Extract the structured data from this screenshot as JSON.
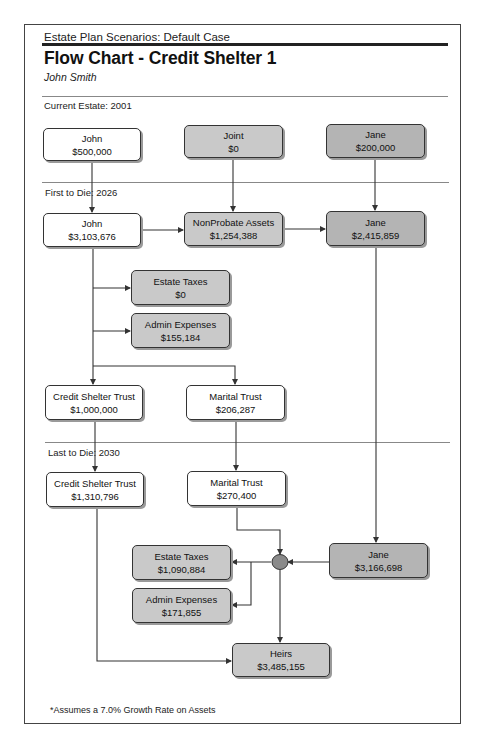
{
  "header": {
    "scenario": "Estate Plan Scenarios:  Default Case",
    "title": "Flow Chart - Credit Shelter 1",
    "client": "John Smith"
  },
  "sections": {
    "current": "Current Estate: 2001",
    "first": "First to Die: 2026",
    "last": "Last to Die: 2030"
  },
  "nodes": {
    "john_current": {
      "label": "John",
      "value": "$500,000"
    },
    "joint_current": {
      "label": "Joint",
      "value": "$0"
    },
    "jane_current": {
      "label": "Jane",
      "value": "$200,000"
    },
    "john_first": {
      "label": "John",
      "value": "$3,103,676"
    },
    "nonprobate_first": {
      "label": "NonProbate Assets",
      "value": "$1,254,388"
    },
    "jane_first": {
      "label": "Jane",
      "value": "$2,415,859"
    },
    "estate_taxes_first": {
      "label": "Estate Taxes",
      "value": "$0"
    },
    "admin_expenses_first": {
      "label": "Admin Expenses",
      "value": "$155,184"
    },
    "cst_first": {
      "label": "Credit Shelter Trust",
      "value": "$1,000,000"
    },
    "marital_first": {
      "label": "Marital Trust",
      "value": "$206,287"
    },
    "cst_last": {
      "label": "Credit Shelter Trust",
      "value": "$1,310,796"
    },
    "marital_last": {
      "label": "Marital Trust",
      "value": "$270,400"
    },
    "jane_last": {
      "label": "Jane",
      "value": "$3,166,698"
    },
    "estate_taxes_last": {
      "label": "Estate Taxes",
      "value": "$1,090,884"
    },
    "admin_expenses_last": {
      "label": "Admin Expenses",
      "value": "$171,855"
    },
    "heirs": {
      "label": "Heirs",
      "value": "$3,485,155"
    }
  },
  "footnote": "*Assumes a 7.0% Growth Rate on Assets",
  "colors": {
    "frame": "#444444",
    "white_box": "#ffffff",
    "shaded_box": "#c9c9c9",
    "dark_box": "#b4b4b4",
    "line": "#333333"
  }
}
